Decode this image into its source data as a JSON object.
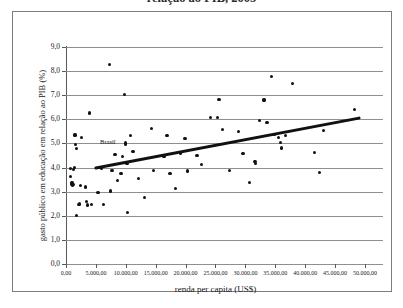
{
  "figure": {
    "caption_clipped": "relação ao PIB, 2005"
  },
  "chart_data": {
    "type": "scatter",
    "title": "",
    "xlabel": "renda per capita (US$)",
    "ylabel": "gasto público em educação em relação ao PIB (%)",
    "xlim": [
      0,
      50000
    ],
    "ylim": [
      0,
      9
    ],
    "grid": true,
    "legend": "none",
    "x_tick_labels": [
      "0,00",
      "5.000,00",
      "10.000,00",
      "15.000,00",
      "20.000,00",
      "25.000,00",
      "30.000,00",
      "35.000,00",
      "40.000,00",
      "45.000,00",
      "50.000,00"
    ],
    "x_tick_values": [
      0,
      5000,
      10000,
      15000,
      20000,
      25000,
      30000,
      35000,
      40000,
      45000,
      50000
    ],
    "y_tick_labels": [
      "0,0",
      "1,0",
      "2,0",
      "3,0",
      "4,0",
      "5,0",
      "6,0",
      "7,0",
      "8,0",
      "9,0"
    ],
    "y_tick_values": [
      0,
      1,
      2,
      3,
      4,
      5,
      6,
      7,
      8,
      9
    ],
    "annotations": [
      {
        "text": "Brasil",
        "x": 7000,
        "y": 5.05
      }
    ],
    "trendline": {
      "label": "linha de tendência",
      "x": [
        5000,
        49000
      ],
      "y": [
        3.98,
        6.05
      ],
      "color": "#111111"
    },
    "points": [
      {
        "x": 800,
        "y": 3.95
      },
      {
        "x": 800,
        "y": 3.62
      },
      {
        "x": 900,
        "y": 3.3
      },
      {
        "x": 1000,
        "y": 3.36
      },
      {
        "x": 1100,
        "y": 3.25
      },
      {
        "x": 1200,
        "y": 3.3
      },
      {
        "x": 1300,
        "y": 3.92
      },
      {
        "x": 1400,
        "y": 3.99
      },
      {
        "x": 1500,
        "y": 5.35
      },
      {
        "x": 1600,
        "y": 4.97
      },
      {
        "x": 1700,
        "y": 4.8
      },
      {
        "x": 1800,
        "y": 2.0
      },
      {
        "x": 2100,
        "y": 2.47
      },
      {
        "x": 2300,
        "y": 2.49
      },
      {
        "x": 2400,
        "y": 3.27
      },
      {
        "x": 2600,
        "y": 5.25
      },
      {
        "x": 3200,
        "y": 3.19
      },
      {
        "x": 3400,
        "y": 2.58
      },
      {
        "x": 3600,
        "y": 2.45
      },
      {
        "x": 3900,
        "y": 6.26
      },
      {
        "x": 4300,
        "y": 2.46
      },
      {
        "x": 5200,
        "y": 2.96
      },
      {
        "x": 5400,
        "y": 2.95
      },
      {
        "x": 5600,
        "y": 3.99
      },
      {
        "x": 6000,
        "y": 3.97
      },
      {
        "x": 6300,
        "y": 2.46
      },
      {
        "x": 7300,
        "y": 8.27
      },
      {
        "x": 7400,
        "y": 3.03
      },
      {
        "x": 7700,
        "y": 3.88
      },
      {
        "x": 8200,
        "y": 4.55
      },
      {
        "x": 8600,
        "y": 3.47
      },
      {
        "x": 9200,
        "y": 3.76
      },
      {
        "x": 9500,
        "y": 4.45
      },
      {
        "x": 9800,
        "y": 7.04
      },
      {
        "x": 9900,
        "y": 5.02
      },
      {
        "x": 10000,
        "y": 4.96
      },
      {
        "x": 10100,
        "y": 4.22
      },
      {
        "x": 10200,
        "y": 4.18
      },
      {
        "x": 10300,
        "y": 2.15
      },
      {
        "x": 10800,
        "y": 5.34
      },
      {
        "x": 11200,
        "y": 4.68
      },
      {
        "x": 12100,
        "y": 3.56
      },
      {
        "x": 13100,
        "y": 2.75
      },
      {
        "x": 14300,
        "y": 5.63
      },
      {
        "x": 14600,
        "y": 3.87
      },
      {
        "x": 16400,
        "y": 4.45
      },
      {
        "x": 16900,
        "y": 5.32
      },
      {
        "x": 17400,
        "y": 3.74
      },
      {
        "x": 18300,
        "y": 3.12
      },
      {
        "x": 19200,
        "y": 4.6
      },
      {
        "x": 19900,
        "y": 5.21
      },
      {
        "x": 20300,
        "y": 3.86
      },
      {
        "x": 21900,
        "y": 4.5
      },
      {
        "x": 22600,
        "y": 4.11
      },
      {
        "x": 24100,
        "y": 6.09
      },
      {
        "x": 25300,
        "y": 6.09
      },
      {
        "x": 25600,
        "y": 6.82
      },
      {
        "x": 26200,
        "y": 5.58
      },
      {
        "x": 27300,
        "y": 3.88
      },
      {
        "x": 28900,
        "y": 5.48
      },
      {
        "x": 29600,
        "y": 4.57
      },
      {
        "x": 30700,
        "y": 3.38
      },
      {
        "x": 31600,
        "y": 4.24
      },
      {
        "x": 31700,
        "y": 4.18
      },
      {
        "x": 32300,
        "y": 5.95
      },
      {
        "x": 33100,
        "y": 6.8
      },
      {
        "x": 33600,
        "y": 5.87
      },
      {
        "x": 34400,
        "y": 7.79
      },
      {
        "x": 34800,
        "y": 5.38
      },
      {
        "x": 35600,
        "y": 5.25
      },
      {
        "x": 35900,
        "y": 5.05
      },
      {
        "x": 36000,
        "y": 4.81
      },
      {
        "x": 36700,
        "y": 5.33
      },
      {
        "x": 37900,
        "y": 7.47
      },
      {
        "x": 41500,
        "y": 4.64
      },
      {
        "x": 42400,
        "y": 3.78
      },
      {
        "x": 43100,
        "y": 5.55
      },
      {
        "x": 48300,
        "y": 6.42
      }
    ]
  }
}
